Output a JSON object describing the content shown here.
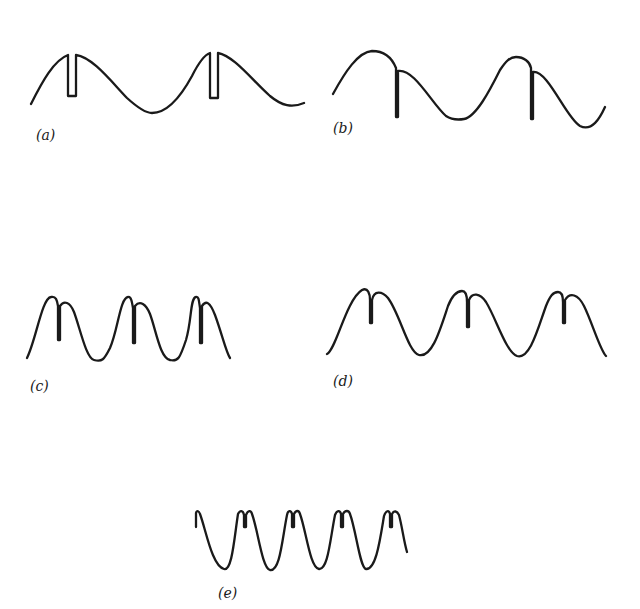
{
  "figure": {
    "stroke_color": "#1a1a1a",
    "background": "#ffffff"
  },
  "panels": [
    {
      "id": "a",
      "label": "(a)",
      "label_pos": [
        36,
        128
      ],
      "description": "Sine wave, two periods, with rectangular notch cut into each crest",
      "path": "M31,104 C42,82 54,60 68,55 L68,96 L76,96 L76,55 C92,57 110,80 127,98 C138,108 146,113 152,113 C166,113 180,98 192,76 C198,64 204,55 210,53 L210,98 L218,98 L218,53 C234,56 252,80 270,96 C282,106 292,108 304,103"
    },
    {
      "id": "b",
      "label": "(b)",
      "label_pos": [
        333,
        121
      ],
      "description": "Sine wave, two periods, with a sharp downward spike just after each crest",
      "path": "M333,94 C345,72 358,52 372,51 C384,51 392,58 396,68 L396,117 L398,117 L398,71 C414,68 432,104 446,116 C452,120 458,120 464,119 C476,117 490,90 500,70 C506,61 510,57 516,57 C524,57 530,62 531,68 L531,119 L533,119 L533,72 C548,70 566,118 580,126 C592,132 600,118 605,107"
    },
    {
      "id": "c",
      "label": "(c)",
      "label_pos": [
        30,
        379
      ],
      "description": "Three periods of a sharper wave with a narrow vertical notch dividing each crest",
      "path": "M27,358 C36,340 42,298 51,297 C56,296 57,300 58,306 L58,340 L60,340 L60,306 C64,300 70,302 74,312 C80,328 86,358 94,360 C102,362 104,360 110,348 C118,330 120,298 128,297 C131,296 132,302 133,308 L133,343 L135,343 L135,306 C140,300 146,304 150,314 C156,330 160,358 170,360 C178,362 180,358 186,340 C192,320 190,298 196,297 C199,296 199,302 200,308 L200,343 L202,343 L202,306 C206,300 210,302 215,315 C222,334 226,352 230,358"
    },
    {
      "id": "d",
      "label": "(d)",
      "label_pos": [
        333,
        374
      ],
      "description": "Three periods with a narrow spike notch on each crest, broader troughs",
      "path": "M327,354 C336,350 346,300 362,290 C368,287 370,294 370,300 L370,323 L372,323 L372,300 C374,290 382,291 388,298 C400,314 408,352 419,355 C432,358 440,330 448,306 C452,296 456,291 462,291 C466,291 467,296 467,302 L467,327 L469,327 L469,300 C472,292 480,293 486,302 C496,318 506,352 517,356 C530,360 538,328 546,306 C550,296 553,292 558,292 C562,292 563,298 563,302 L563,323 L565,323 L565,300 C570,292 578,294 584,306 C592,322 600,350 606,356"
    },
    {
      "id": "e",
      "label": "(e)",
      "label_pos": [
        218,
        586
      ],
      "description": "Five periods of a deep sharply-peaked wave, each crest split by a small notch",
      "path": "M196,527 L196,513 C197,510 199,511 200,514 C206,530 212,566 224,569 C232,571 234,540 238,514 C240,510 243,510 244,515 L244,527 L246,527 L246,515 C248,510 251,510 252,514 C258,530 262,568 270,570 C280,572 282,540 287,515 C288,510 291,510 292,514 L292,527 L294,527 L294,514 C296,510 299,510 300,514 C306,530 310,568 319,569 C328,570 330,540 335,515 C337,510 340,510 341,514 L341,527 L343,527 L343,514 C345,510 349,510 350,514 C356,530 360,568 366,569 C376,570 380,540 384,516 C386,510 389,510 390,514 L390,527 L392,527 L392,514 C394,510 397,511 399,515 C402,526 404,542 407,552"
    }
  ]
}
